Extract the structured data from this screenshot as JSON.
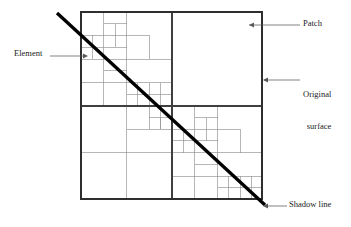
{
  "figure": {
    "type": "quadtree-mesh-diagram",
    "title": "",
    "colors": {
      "outline": "#3a3a3a",
      "mesh_line": "#8a8a8a",
      "mesh_line_strong": "#4a4a4a",
      "shadow_line": "#000000",
      "leader": "#555555",
      "text": "#1a1a1a",
      "background": "#ffffff"
    },
    "surface": {
      "x": 81,
      "y": 12,
      "width": 181,
      "height": 187,
      "center_x": 172,
      "center_y": 106
    },
    "shadow_line": {
      "x1": 57,
      "y1": 13,
      "x2": 265,
      "y2": 205,
      "width": 3.2
    },
    "quadrants": {
      "top_right": "single undivided patch",
      "top_left": "recursively subdivided toward shadow line",
      "bottom_left": "recursively subdivided toward shadow line",
      "bottom_right": "recursively subdivided toward shadow line"
    }
  },
  "labels": [
    {
      "id": "patch",
      "text": "Patch",
      "leader": {
        "x1": 283,
        "y1": 25,
        "x2": 247,
        "y2": 25,
        "arrow": "left"
      }
    },
    {
      "id": "original_surface",
      "line1": "Original",
      "line2": "surface",
      "leader": {
        "x1": 283,
        "y1": 80,
        "x2": 263,
        "y2": 80,
        "arrow": "left"
      }
    },
    {
      "id": "element",
      "text": "Element",
      "leader": {
        "x1": 50,
        "y1": 56,
        "x2": 88,
        "y2": 56,
        "arrow": "right"
      }
    },
    {
      "id": "shadow_line",
      "text": "Shadow line",
      "leader": {
        "x1": 285,
        "y1": 206,
        "x2": 262,
        "y2": 206,
        "arrow": "left"
      }
    }
  ],
  "mesh": {
    "outer": [
      81,
      12,
      181,
      187
    ],
    "strong_lines": [
      [
        81,
        12,
        262,
        12
      ],
      [
        81,
        199,
        262,
        199
      ],
      [
        81,
        12,
        81,
        199
      ],
      [
        262,
        12,
        262,
        199
      ],
      [
        81,
        106,
        262,
        106
      ],
      [
        172,
        12,
        172,
        199
      ]
    ],
    "cells": [
      [
        81,
        12,
        22.7,
        23.4
      ],
      [
        103.7,
        12,
        22.7,
        23.4
      ],
      [
        81,
        35.4,
        22.7,
        23.4
      ],
      [
        103.7,
        35.4,
        22.7,
        23.4
      ],
      [
        126.5,
        12,
        45.5,
        46.8
      ],
      [
        81,
        58.8,
        22.7,
        23.4
      ],
      [
        103.7,
        58.8,
        22.7,
        23.4
      ],
      [
        81,
        82.2,
        22.7,
        23.4
      ],
      [
        103.7,
        82.2,
        22.7,
        23.4
      ],
      [
        126.5,
        58.8,
        45.5,
        23.4
      ],
      [
        126.5,
        82.2,
        22.7,
        23.4
      ],
      [
        149.2,
        82.2,
        22.7,
        23.4
      ],
      [
        81,
        106,
        45.5,
        46.8
      ],
      [
        81,
        152.8,
        45.5,
        46.8
      ],
      [
        126.5,
        152.8,
        45.5,
        46.8
      ],
      [
        126.5,
        106,
        22.7,
        23.4
      ],
      [
        149.2,
        106,
        22.7,
        23.4
      ],
      [
        126.5,
        129.4,
        45.5,
        23.4
      ],
      [
        172,
        106,
        22.7,
        23.4
      ],
      [
        194.7,
        106,
        22.7,
        23.4
      ],
      [
        172,
        129.4,
        22.7,
        23.4
      ],
      [
        194.7,
        129.4,
        22.7,
        23.4
      ],
      [
        217.5,
        106,
        45.5,
        46.8
      ],
      [
        172,
        152.8,
        22.7,
        23.4
      ],
      [
        194.7,
        152.8,
        22.7,
        23.4
      ],
      [
        172,
        176.2,
        22.7,
        23.4
      ],
      [
        194.7,
        176.2,
        22.7,
        23.4
      ],
      [
        217.5,
        152.8,
        45.5,
        23.4
      ],
      [
        217.5,
        176.2,
        22.7,
        23.4
      ],
      [
        240.2,
        176.2,
        22.7,
        23.4
      ],
      [
        172,
        12,
        90,
        94
      ]
    ]
  }
}
